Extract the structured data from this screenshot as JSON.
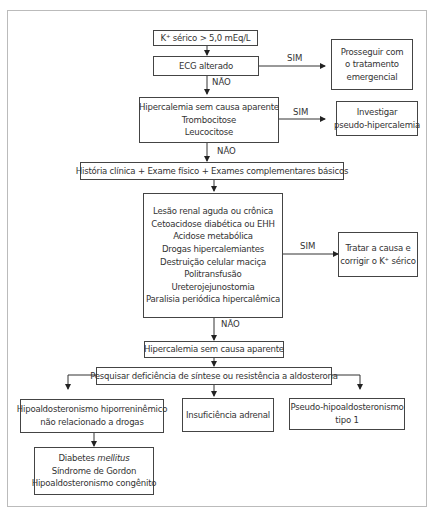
{
  "flowchart": {
    "nodes": {
      "start": {
        "lines": [
          "K⁺ sérico > 5,0 mEq/L"
        ]
      },
      "ecg": {
        "lines": [
          "ECG alterado"
        ]
      },
      "emergency": {
        "lines": [
          "Prosseguir com",
          "o tratamento",
          "emergencial"
        ]
      },
      "no_cause": {
        "lines": [
          "Hipercalemia sem causa aparente",
          "Trombocitose",
          "Leucocitose"
        ]
      },
      "pseudo": {
        "lines": [
          "Investigar",
          "pseudo-hipercalemia"
        ]
      },
      "history": {
        "lines": [
          "História clínica + Exame físico + Exames complementares básicos"
        ]
      },
      "causes": {
        "lines": [
          "Lesão renal aguda ou crônica",
          "Cetoacidose diabética ou EHH",
          "Acidose metabólica",
          "Drogas hipercalemiantes",
          "Destruição celular maciça",
          "Politransfusão",
          "Ureterojejunostomia",
          "Paralisia periódica hipercalêmica"
        ]
      },
      "treat": {
        "lines": [
          "Tratar a causa e",
          "corrigir o K⁺ sérico"
        ]
      },
      "no_cause2": {
        "lines": [
          "Hipercalemia sem causa aparente"
        ]
      },
      "aldosterone": {
        "lines": [
          "Pesquisar deficiência de síntese ou resistência a aldosterona"
        ]
      },
      "hyporeninemic": {
        "lines": [
          "Hipoaldosteronismo hiporreninêmico",
          "não relacionado a drogas"
        ]
      },
      "adrenal": {
        "lines": [
          "Insuficiência adrenal"
        ]
      },
      "pseudohypo": {
        "lines": [
          "Pseudo-hipoaldosteronismo",
          "tipo 1"
        ]
      },
      "subcauses": {
        "line1_prefix": "Diabetes ",
        "line1_italic": "mellitus",
        "lines": [
          "Síndrome de Gordon",
          "Hipoaldosteronismo congênito"
        ]
      }
    },
    "edge_labels": {
      "ecg_yes": "SIM",
      "ecg_no": "NÃO",
      "no_cause_yes": "SIM",
      "no_cause_no": "NÃO",
      "causes_yes": "SIM",
      "causes_no": "NÃO"
    }
  }
}
